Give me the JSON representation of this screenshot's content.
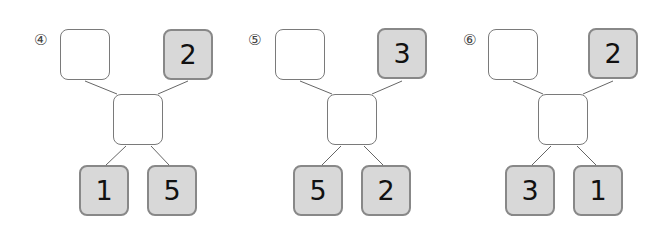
{
  "problems": [
    {
      "label": "④",
      "top_left": "",
      "top_right": "2",
      "middle": "",
      "bottom_left": "1",
      "bottom_right": "5"
    },
    {
      "label": "⑤",
      "top_left": "",
      "top_right": "3",
      "middle": "",
      "bottom_left": "5",
      "bottom_right": "2"
    },
    {
      "label": "⑥",
      "top_left": "",
      "top_right": "2",
      "middle": "",
      "bottom_left": "3",
      "bottom_right": "1"
    }
  ],
  "colors": {
    "given_fill": "#d8d8d8",
    "given_border": "#888888",
    "empty_border": "#7a7a7a",
    "line": "#666666"
  }
}
